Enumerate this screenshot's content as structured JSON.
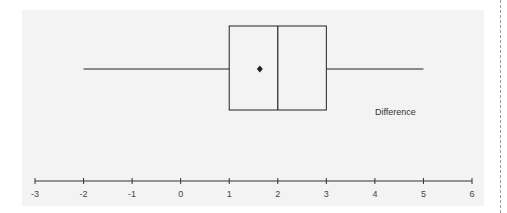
{
  "chart_data": {
    "type": "boxplot",
    "title": "",
    "xlabel": "",
    "ylabel": "",
    "series": [
      {
        "name": "Difference",
        "min": -2,
        "q1": 1,
        "median": 2,
        "q3": 3,
        "max": 5,
        "mean": 1.63
      }
    ],
    "xlim": [
      -3,
      6
    ],
    "ticks": [
      -3,
      -2,
      -1,
      0,
      1,
      2,
      3,
      4,
      5,
      6
    ],
    "tick_labels": [
      "-3",
      "-2",
      "-1",
      "0",
      "1",
      "2",
      "3",
      "4",
      "5",
      "6"
    ],
    "orientation": "horizontal",
    "grid": false,
    "legend": "none"
  },
  "labels": {
    "series_name": "Difference"
  },
  "colors": {
    "panel_bg": "#f3f3f3",
    "line": "#222222"
  }
}
